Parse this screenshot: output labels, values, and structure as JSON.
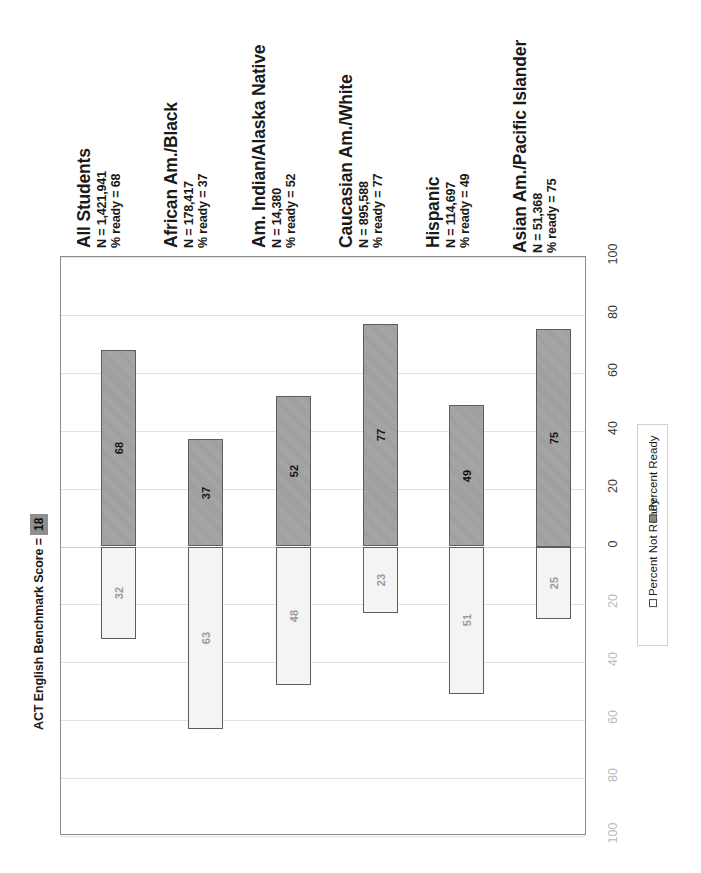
{
  "chart_data": {
    "type": "bar",
    "title": "",
    "subtitle": "",
    "orientation": "rotated-90ccw-stacked-diverging",
    "xlabel": "",
    "ylabel": "",
    "ylim": [
      -100,
      100
    ],
    "grid": true,
    "legend_position": "right",
    "axis_ticks": [
      "100",
      "80",
      "60",
      "40",
      "20",
      "0",
      "20",
      "40",
      "60",
      "80",
      "100"
    ],
    "categories": [
      "All Students",
      "African Am./Black",
      "Am. Indian/Alaska Native",
      "Caucasian Am./White",
      "Hispanic",
      "Asian Am./Pacific Islander"
    ],
    "series": [
      {
        "name": "Percent Ready",
        "values": [
          68,
          37,
          52,
          77,
          49,
          75
        ]
      },
      {
        "name": "Percent Not Ready",
        "values": [
          32,
          63,
          48,
          23,
          51,
          25
        ]
      }
    ],
    "annotations": [
      {
        "text": "ACT English Benchmark Score =",
        "value": "18"
      }
    ]
  },
  "groups": [
    {
      "title": "All Students",
      "n_line": "N =  1,421,941",
      "ready_line": "% ready =  68"
    },
    {
      "title": "African Am./Black",
      "n_line": "N =  178,417",
      "ready_line": "% ready =  37"
    },
    {
      "title": "Am. Indian/Alaska Native",
      "n_line": "N =  14,380",
      "ready_line": "% ready =  52"
    },
    {
      "title": "Caucasian Am./White",
      "n_line": "N =  895,588",
      "ready_line": "% ready =  77"
    },
    {
      "title": "Hispanic",
      "n_line": "N =  114,697",
      "ready_line": "% ready =  49"
    },
    {
      "title": "Asian Am./Pacific Islander",
      "n_line": "N =  51,368",
      "ready_line": "% ready =  75"
    }
  ],
  "bars": [
    {
      "category": "All Students",
      "ready": 68,
      "not_ready": 32,
      "ready_label": "68",
      "not_ready_label": "32"
    },
    {
      "category": "African Am./Black",
      "ready": 37,
      "not_ready": 63,
      "ready_label": "37",
      "not_ready_label": "63"
    },
    {
      "category": "Am. Indian/Alaska Native",
      "ready": 52,
      "not_ready": 48,
      "ready_label": "52",
      "not_ready_label": "48"
    },
    {
      "category": "Caucasian Am./White",
      "ready": 77,
      "not_ready": 23,
      "ready_label": "77",
      "not_ready_label": "23"
    },
    {
      "category": "Hispanic",
      "ready": 49,
      "not_ready": 51,
      "ready_label": "49",
      "not_ready_label": "51"
    },
    {
      "category": "Asian Am./Pacific Islander",
      "ready": 75,
      "not_ready": 25,
      "ready_label": "75",
      "not_ready_label": "25"
    }
  ],
  "axis": {
    "ticks": [
      {
        "label": "100",
        "value": 100,
        "faint": false
      },
      {
        "label": "80",
        "value": 80,
        "faint": false
      },
      {
        "label": "60",
        "value": 60,
        "faint": false
      },
      {
        "label": "40",
        "value": 40,
        "faint": false
      },
      {
        "label": "20",
        "value": 20,
        "faint": false
      },
      {
        "label": "0",
        "value": 0,
        "faint": false
      },
      {
        "label": "20",
        "value": -20,
        "faint": true
      },
      {
        "label": "40",
        "value": -40,
        "faint": true
      },
      {
        "label": "60",
        "value": -60,
        "faint": true
      },
      {
        "label": "80",
        "value": -80,
        "faint": true
      },
      {
        "label": "100",
        "value": -100,
        "faint": true
      }
    ]
  },
  "benchmark": {
    "text": "ACT English Benchmark Score =",
    "value": "18"
  },
  "legend": {
    "items": [
      {
        "label": "Percent Not Ready",
        "swatch": "notready",
        "color": "#ffffff"
      },
      {
        "label": "Percent Ready",
        "swatch": "ready",
        "color": "#8a8a8a"
      }
    ]
  },
  "colors": {
    "ready_fill": "#9c9c9c",
    "not_ready_fill": "#f4f4f4",
    "bar_border": "#5d5d5d",
    "frame": "#8c8c8c",
    "gridline": "#e2e2e2",
    "benchmark_box": "#8f8f8f"
  }
}
